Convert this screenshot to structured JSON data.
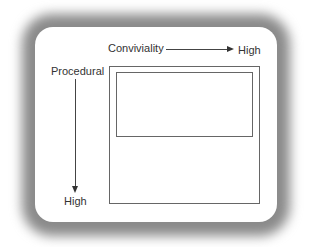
{
  "diagram": {
    "horizontal_axis": {
      "label": "Conviviality",
      "end_label": "High",
      "direction": "right"
    },
    "vertical_axis": {
      "label": "Procedural",
      "end_label": "High",
      "direction": "down"
    },
    "regions": [
      {
        "name": "outer-region",
        "label": ""
      },
      {
        "name": "inner-region",
        "label": ""
      }
    ]
  }
}
